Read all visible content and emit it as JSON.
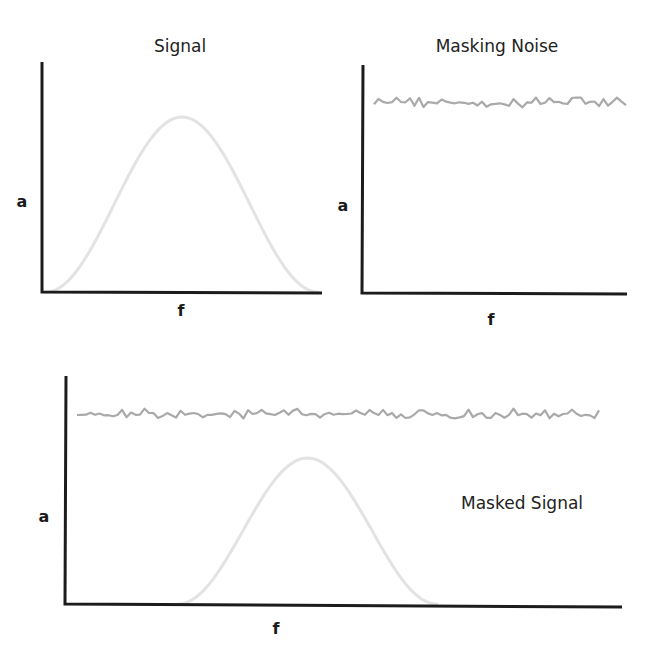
{
  "colors": {
    "axis": "#1c1c1c",
    "noise": "#a9a9a9",
    "signal": "#e3e3e3",
    "text": "#222222"
  },
  "panels": {
    "signal": {
      "title": "Signal",
      "ylabel": "a",
      "xlabel": "f"
    },
    "noise": {
      "title": "Masking Noise",
      "ylabel": "a",
      "xlabel": "f"
    },
    "masked": {
      "label": "Masked Signal",
      "ylabel": "a",
      "xlabel": "f"
    }
  },
  "chart_data": [
    {
      "type": "line",
      "title": "Signal",
      "xlabel": "f",
      "ylabel": "a",
      "grid": false,
      "series": [
        {
          "name": "signal",
          "shape": "bell curve",
          "x": [
            0.0,
            0.1,
            0.2,
            0.3,
            0.4,
            0.5,
            0.6,
            0.7,
            0.8,
            0.9,
            1.0
          ],
          "values": [
            0.0,
            0.1,
            0.33,
            0.65,
            0.9,
            1.0,
            0.9,
            0.65,
            0.33,
            0.1,
            0.0
          ]
        }
      ],
      "ylim": [
        0,
        1.35
      ]
    },
    {
      "type": "line",
      "title": "Masking Noise",
      "xlabel": "f",
      "ylabel": "a",
      "grid": false,
      "series": [
        {
          "name": "noise",
          "shape": "flat broadband noise",
          "level": 0.84
        }
      ],
      "ylim": [
        0,
        1
      ]
    },
    {
      "type": "line",
      "title": "Masked Signal",
      "xlabel": "f",
      "ylabel": "a",
      "grid": false,
      "series": [
        {
          "name": "noise",
          "shape": "flat broadband noise",
          "level": 0.84
        },
        {
          "name": "signal",
          "shape": "bell curve, peak below noise level",
          "x": [
            0.0,
            0.2,
            0.3,
            0.4,
            0.45,
            0.5,
            0.55,
            0.6,
            0.7,
            0.8,
            1.0
          ],
          "values": [
            0.0,
            0.0,
            0.25,
            0.62,
            0.75,
            0.78,
            0.75,
            0.62,
            0.25,
            0.0,
            0.0
          ]
        }
      ],
      "ylim": [
        0,
        1
      ],
      "annotation": "Masked Signal"
    }
  ]
}
